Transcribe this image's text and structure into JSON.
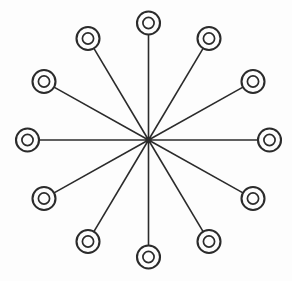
{
  "diagram": {
    "title": "Radial star hub-and-spoke diagram",
    "type": "radial-star-graph",
    "background_color": "#fdfdfd",
    "stroke_color": "#2b2b2b",
    "canvas": {
      "width": 292,
      "height": 281
    },
    "hub": {
      "name": "center-hub",
      "label": "",
      "x": 148.5,
      "y": 140.0,
      "dot_radius": 3.2
    },
    "node_geometry": {
      "outer_radius": 11.5,
      "inner_radius": 5.6,
      "count": 12,
      "angle_step_degrees": 30,
      "orbit_radius_x": 121,
      "orbit_radius_y": 117
    },
    "nodes": [
      {
        "name": "node-00",
        "label": "",
        "angle": 270,
        "x": 148.5,
        "y": 23.0
      },
      {
        "name": "node-01",
        "label": "",
        "angle": 300,
        "x": 209.0,
        "y": 38.5
      },
      {
        "name": "node-02",
        "label": "",
        "angle": 330,
        "x": 253.0,
        "y": 81.5
      },
      {
        "name": "node-03",
        "label": "",
        "angle": 0,
        "x": 269.5,
        "y": 140.0
      },
      {
        "name": "node-04",
        "label": "",
        "angle": 30,
        "x": 253.0,
        "y": 198.5
      },
      {
        "name": "node-05",
        "label": "",
        "angle": 60,
        "x": 209.0,
        "y": 241.5
      },
      {
        "name": "node-06",
        "label": "",
        "angle": 90,
        "x": 148.5,
        "y": 257.0
      },
      {
        "name": "node-07",
        "label": "",
        "angle": 120,
        "x": 88.0,
        "y": 241.5
      },
      {
        "name": "node-08",
        "label": "",
        "angle": 150,
        "x": 44.0,
        "y": 198.5
      },
      {
        "name": "node-09",
        "label": "",
        "angle": 180,
        "x": 27.5,
        "y": 140.0
      },
      {
        "name": "node-10",
        "label": "",
        "angle": 210,
        "x": 44.0,
        "y": 81.5
      },
      {
        "name": "node-11",
        "label": "",
        "angle": 240,
        "x": 88.0,
        "y": 38.5
      }
    ],
    "edges": [
      {
        "name": "spoke-00",
        "from": "center-hub",
        "to": "node-00"
      },
      {
        "name": "spoke-01",
        "from": "center-hub",
        "to": "node-01"
      },
      {
        "name": "spoke-02",
        "from": "center-hub",
        "to": "node-02"
      },
      {
        "name": "spoke-03",
        "from": "center-hub",
        "to": "node-03"
      },
      {
        "name": "spoke-04",
        "from": "center-hub",
        "to": "node-04"
      },
      {
        "name": "spoke-05",
        "from": "center-hub",
        "to": "node-05"
      },
      {
        "name": "spoke-06",
        "from": "center-hub",
        "to": "node-06"
      },
      {
        "name": "spoke-07",
        "from": "center-hub",
        "to": "node-07"
      },
      {
        "name": "spoke-08",
        "from": "center-hub",
        "to": "node-08"
      },
      {
        "name": "spoke-09",
        "from": "center-hub",
        "to": "node-09"
      },
      {
        "name": "spoke-10",
        "from": "center-hub",
        "to": "node-10"
      },
      {
        "name": "spoke-11",
        "from": "center-hub",
        "to": "node-11"
      }
    ]
  }
}
